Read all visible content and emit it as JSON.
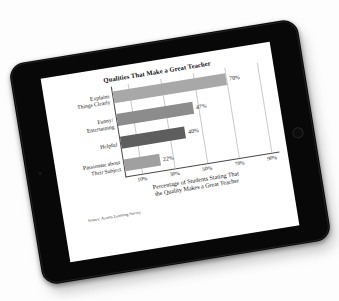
{
  "device": {
    "type": "tablet",
    "bezel_color": "#080808",
    "screen_background": "#ffffff",
    "home_button": "home-button",
    "front_camera": "front-camera"
  },
  "chart_data": {
    "type": "bar",
    "orientation": "horizontal",
    "title": "Qualities That Make a Great Teacher",
    "categories": [
      "Explains\nThings Clearly",
      "Funny/\nEntertaining",
      "Helpful",
      "Passionate about\nTheir Subject"
    ],
    "values": [
      70,
      47,
      40,
      22
    ],
    "value_labels": [
      "70%",
      "47%",
      "40%",
      "22%"
    ],
    "bar_colors": [
      "#a8a8a8",
      "#8c8c8c",
      "#5e5e5e",
      "#a0a0a0"
    ],
    "xlabel": "Percentage of Students Stating That\nthe Quality Makes a Great Teacher",
    "ylabel": "",
    "xlim": [
      0,
      95
    ],
    "xticks": [
      10,
      30,
      50,
      70,
      90
    ],
    "xtick_labels": [
      "10%",
      "30%",
      "50%",
      "70%",
      "90%"
    ],
    "grid": true,
    "grid_axis": "x",
    "legend": false,
    "source": "Source: Acorns Learning Survey"
  }
}
